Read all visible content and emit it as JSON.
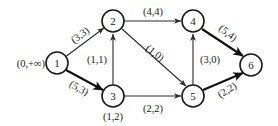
{
  "diagram": {
    "colors": {
      "node_stroke": "#1a1a1a",
      "edge_stroke": "#2b2b2b",
      "bold_edge_stroke": "#111111",
      "background": "#ffffff",
      "text": "#1a1a1a"
    },
    "source_annotation": "(0,+∞)",
    "nodes": [
      {
        "id": "1",
        "label": "1",
        "cx": 57,
        "cy": 63,
        "r": 11
      },
      {
        "id": "2",
        "label": "2",
        "cx": 113,
        "cy": 21,
        "r": 11
      },
      {
        "id": "3",
        "label": "3",
        "cx": 113,
        "cy": 96,
        "r": 11
      },
      {
        "id": "4",
        "label": "4",
        "cx": 193,
        "cy": 21,
        "r": 11
      },
      {
        "id": "5",
        "label": "5",
        "cx": 193,
        "cy": 96,
        "r": 11
      },
      {
        "id": "6",
        "label": "6",
        "cx": 251,
        "cy": 65,
        "r": 11
      }
    ],
    "node_annotations": [
      {
        "node": "3",
        "label": "(1,2)",
        "x": 113,
        "y": 116
      }
    ],
    "edges": [
      {
        "id": "e1-2",
        "from": "1",
        "to": "2",
        "label": "(3,3)",
        "lx": 80,
        "ly": 35,
        "rotate": -36,
        "bold": false
      },
      {
        "id": "e1-3",
        "from": "1",
        "to": "3",
        "label": "(5,3)",
        "lx": 79,
        "ly": 88,
        "rotate": 30,
        "bold": true
      },
      {
        "id": "e2-4",
        "from": "2",
        "to": "4",
        "label": "(4,4)",
        "lx": 153,
        "ly": 11,
        "rotate": 0,
        "bold": false
      },
      {
        "id": "e3-2",
        "from": "3",
        "to": "2",
        "label": "(1,1)",
        "lx": 97,
        "ly": 59,
        "rotate": 0,
        "bold": false
      },
      {
        "id": "e2-5",
        "from": "2",
        "to": "5",
        "label": "(1,0)",
        "lx": 155,
        "ly": 53,
        "rotate": 38,
        "bold": false
      },
      {
        "id": "e5-4",
        "from": "5",
        "to": "4",
        "label": "(3,0)",
        "lx": 210,
        "ly": 59,
        "rotate": 0,
        "bold": false
      },
      {
        "id": "e3-5",
        "from": "3",
        "to": "5",
        "label": "(2,2)",
        "lx": 153,
        "ly": 108,
        "rotate": 0,
        "bold": false
      },
      {
        "id": "e4-6",
        "from": "4",
        "to": "6",
        "label": "(5,4)",
        "lx": 228,
        "ly": 33,
        "rotate": 38,
        "bold": true
      },
      {
        "id": "e5-6",
        "from": "5",
        "to": "6",
        "label": "(2,2)",
        "lx": 227,
        "ly": 90,
        "rotate": -32,
        "bold": true
      }
    ]
  }
}
